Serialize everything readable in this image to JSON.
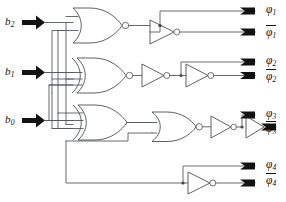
{
  "diagram": {
    "type": "logic-circuit-schematic"
  },
  "inputs": [
    {
      "id": "b2",
      "label": "b",
      "subscript": "2",
      "name": "input-b2"
    },
    {
      "id": "b1",
      "label": "b",
      "subscript": "1",
      "name": "input-b1"
    },
    {
      "id": "b0",
      "label": "b",
      "subscript": "0",
      "name": "input-b0"
    }
  ],
  "outputs": [
    {
      "id": "phi1",
      "label": "φ",
      "subscript": "1",
      "inverted": false,
      "name": "output-phi1"
    },
    {
      "id": "phi1_bar",
      "label": "φ",
      "subscript": "1",
      "inverted": true,
      "name": "output-phi1-bar"
    },
    {
      "id": "phi2",
      "label": "φ",
      "subscript": "2",
      "inverted": false,
      "name": "output-phi2"
    },
    {
      "id": "phi2_bar",
      "label": "φ",
      "subscript": "2",
      "inverted": true,
      "name": "output-phi2-bar"
    },
    {
      "id": "phi3",
      "label": "φ",
      "subscript": "3",
      "inverted": false,
      "name": "output-phi3"
    },
    {
      "id": "phi3_bar",
      "label": "φ",
      "subscript": "3",
      "inverted": true,
      "name": "output-phi3-bar"
    },
    {
      "id": "phi4",
      "label": "φ",
      "subscript": "4",
      "inverted": false,
      "name": "output-phi4"
    },
    {
      "id": "phi4_bar",
      "label": "φ",
      "subscript": "4",
      "inverted": true,
      "name": "output-phi4-bar"
    }
  ],
  "gates": [
    {
      "id": "g1",
      "kind": "NOR",
      "row": 1,
      "name": "gate-nor-1"
    },
    {
      "id": "g2",
      "kind": "XNOR",
      "row": 2,
      "name": "gate-xnor-2"
    },
    {
      "id": "g3",
      "kind": "XOR",
      "row": 3,
      "name": "gate-xor-3"
    },
    {
      "id": "g4",
      "kind": "NOR",
      "row": 3,
      "name": "gate-nor-4"
    },
    {
      "id": "i1",
      "kind": "INV",
      "row": 1,
      "name": "inverter-1"
    },
    {
      "id": "i2",
      "kind": "INV",
      "row": 2,
      "name": "inverter-2"
    },
    {
      "id": "i3",
      "kind": "INV",
      "row": 2,
      "name": "inverter-3"
    },
    {
      "id": "i4",
      "kind": "INV",
      "row": 3,
      "name": "inverter-4"
    },
    {
      "id": "i5",
      "kind": "INV",
      "row": 3,
      "name": "inverter-5"
    },
    {
      "id": "i6",
      "kind": "INV",
      "row": 4,
      "name": "inverter-6"
    }
  ],
  "colors": {
    "wire": "#555a5e",
    "gate_stroke": "#4a4f53",
    "pin": "#121212",
    "background": "#ffffff",
    "text": "#111111"
  }
}
